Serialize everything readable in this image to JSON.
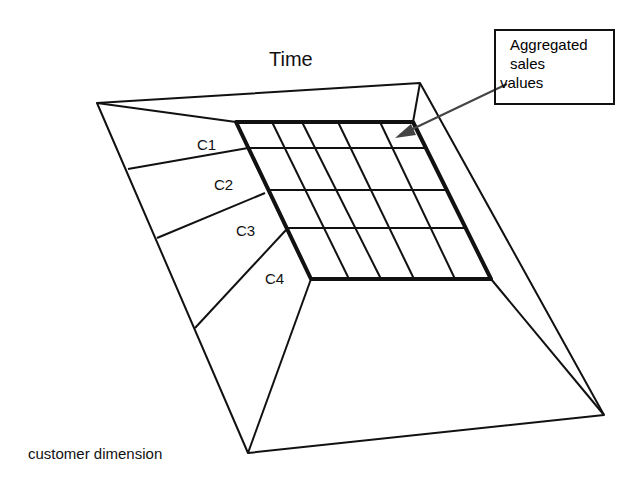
{
  "diagram": {
    "title": "Time",
    "callout": {
      "lines": [
        "Aggregated",
        "sales",
        "values"
      ]
    },
    "customer_labels": [
      "C1",
      "C2",
      "C3",
      "C4"
    ],
    "axis_label": "customer dimension",
    "grid": {
      "rows": 4,
      "columns": 5
    },
    "colors": {
      "line": "#111111",
      "arrow": "#444444",
      "background": "#ffffff"
    }
  }
}
